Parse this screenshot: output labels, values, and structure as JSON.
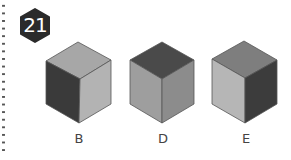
{
  "question": {
    "number": "21"
  },
  "options": [
    {
      "label": "B",
      "faces": {
        "top": "#a7a7a7",
        "left": "#3a3a3a",
        "right": "#b3b3b3"
      }
    },
    {
      "label": "D",
      "faces": {
        "top": "#4a4a4a",
        "left": "#9e9e9e",
        "right": "#8c8c8c"
      }
    },
    {
      "label": "E",
      "faces": {
        "top": "#7e7e7e",
        "left": "#b6b6b6",
        "right": "#3c3c3c"
      }
    }
  ],
  "colors": {
    "badge": "#2b2b2b",
    "edge": "#555555",
    "label": "#444444",
    "dots": "#555555"
  }
}
